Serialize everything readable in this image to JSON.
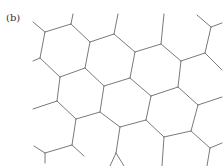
{
  "figure": {
    "panel_label": "(b)",
    "line_color": "#7a7a7a",
    "background": "#ffffff",
    "edges": [
      [
        45,
        32,
        71,
        24
      ],
      [
        71,
        24,
        90,
        42
      ],
      [
        90,
        42,
        85,
        68
      ],
      [
        85,
        68,
        60,
        77
      ],
      [
        60,
        77,
        40,
        58
      ],
      [
        40,
        58,
        45,
        32
      ],
      [
        45,
        32,
        33,
        22
      ],
      [
        71,
        24,
        73,
        14
      ],
      [
        40,
        58,
        33,
        61
      ],
      [
        90,
        42,
        114,
        34
      ],
      [
        114,
        34,
        118,
        14
      ],
      [
        114,
        34,
        135,
        52
      ],
      [
        135,
        52,
        161,
        44
      ],
      [
        161,
        44,
        164,
        14
      ],
      [
        161,
        44,
        181,
        61
      ],
      [
        181,
        61,
        205,
        53
      ],
      [
        205,
        53,
        211,
        27
      ],
      [
        211,
        27,
        197,
        15
      ],
      [
        211,
        27,
        222,
        23
      ],
      [
        205,
        53,
        222,
        70
      ],
      [
        135,
        52,
        130,
        78
      ],
      [
        85,
        68,
        104,
        86
      ],
      [
        130,
        78,
        104,
        86
      ],
      [
        181,
        61,
        178,
        87
      ],
      [
        130,
        78,
        151,
        96
      ],
      [
        151,
        96,
        178,
        87
      ],
      [
        178,
        87,
        198,
        105
      ],
      [
        198,
        105,
        222,
        97
      ],
      [
        104,
        86,
        100,
        112
      ],
      [
        60,
        77,
        57,
        101
      ],
      [
        57,
        101,
        33,
        109
      ],
      [
        57,
        101,
        76,
        119
      ],
      [
        76,
        119,
        100,
        112
      ],
      [
        100,
        112,
        120,
        127
      ],
      [
        120,
        127,
        146,
        120
      ],
      [
        146,
        120,
        151,
        96
      ],
      [
        146,
        120,
        164,
        137
      ],
      [
        164,
        137,
        191,
        131
      ],
      [
        191,
        131,
        198,
        105
      ],
      [
        191,
        131,
        210,
        148
      ],
      [
        210,
        148,
        222,
        143
      ],
      [
        210,
        148,
        207,
        166
      ],
      [
        76,
        119,
        72,
        145
      ],
      [
        72,
        145,
        45,
        153
      ],
      [
        45,
        153,
        34,
        146
      ],
      [
        45,
        153,
        45,
        163
      ],
      [
        72,
        145,
        84,
        156
      ],
      [
        120,
        127,
        116,
        153
      ],
      [
        116,
        153,
        110,
        166
      ],
      [
        116,
        153,
        124,
        166
      ],
      [
        164,
        137,
        162,
        166
      ]
    ]
  }
}
